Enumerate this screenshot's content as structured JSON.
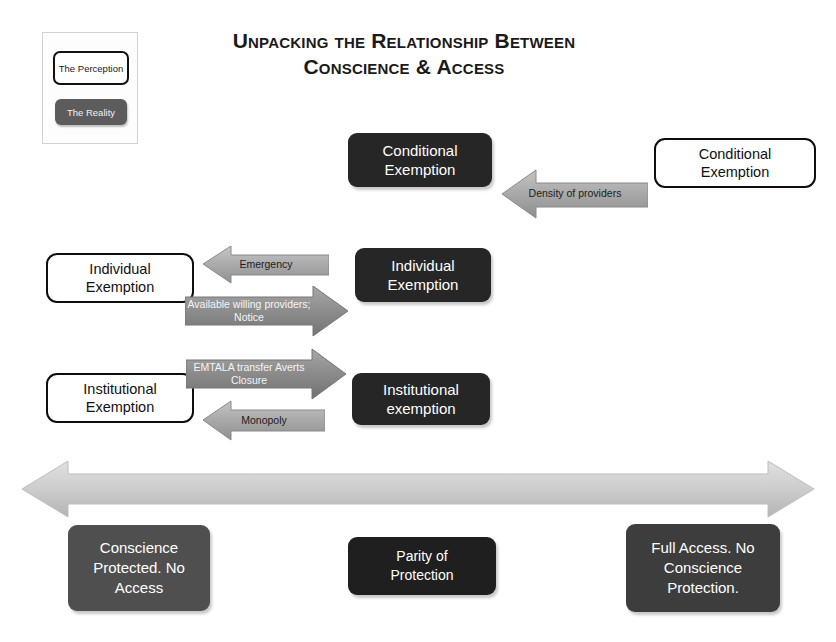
{
  "title": {
    "line1": "Unpacking the Relationship Between",
    "line2": "Conscience & Access"
  },
  "legend": {
    "perception_label": "The Perception",
    "reality_label": "The Reality",
    "perception_color": "#ffffff",
    "reality_color": "#5c5c5c"
  },
  "rows": [
    {
      "id": "conditional",
      "reality_label": "Conditional Exemption",
      "perception_label": "Conditional Exemption",
      "arrows": [
        {
          "direction": "left",
          "label": "Density of providers",
          "text_tone": "dark"
        }
      ]
    },
    {
      "id": "individual",
      "reality_label": "Individual Exemption",
      "perception_label": "Individual Exemption",
      "arrows": [
        {
          "direction": "left",
          "label": "Emergency",
          "text_tone": "dark"
        },
        {
          "direction": "right",
          "label": "Available willing providers; Notice",
          "text_tone": "light"
        }
      ]
    },
    {
      "id": "institutional",
      "reality_label": "Institutional exemption",
      "perception_label": "Institutional Exemption",
      "arrows": [
        {
          "direction": "right",
          "label": "EMTALA transfer Averts Closure",
          "text_tone": "light"
        },
        {
          "direction": "left",
          "label": "Monopoly",
          "text_tone": "dark"
        }
      ]
    }
  ],
  "arrow_labels": {
    "density": "Density of providers",
    "emergency": "Emergency",
    "available_line1": "Available willing",
    "available_line2": "providers; Notice",
    "emtala_line1": "EMTALA transfer",
    "emtala_line2": "Averts Closure",
    "monopoly": "Monopoly"
  },
  "nodes": {
    "conditional_reality_line1": "Conditional",
    "conditional_reality_line2": "Exemption",
    "conditional_perception_line1": "Conditional",
    "conditional_perception_line2": "Exemption",
    "individual_reality_line1": "Individual",
    "individual_reality_line2": "Exemption",
    "individual_perception_line1": "Individual",
    "individual_perception_line2": "Exemption",
    "institutional_reality_line1": "Institutional",
    "institutional_reality_line2": "exemption",
    "institutional_perception_line1": "Institutional",
    "institutional_perception_line2": "Exemption"
  },
  "spectrum": {
    "left_box": {
      "line1": "Conscience",
      "line2": "Protected. No",
      "line3": "Access",
      "color": "#5f5f5f"
    },
    "center_box": {
      "line1": "Parity of",
      "line2": "Protection",
      "color": "#1f1f1f"
    },
    "right_box": {
      "line1": "Full Access. No",
      "line2": "Conscience",
      "line3": "Protection.",
      "color": "#3d3d3d"
    },
    "axis_color": "#c9c9c9",
    "axis_direction": "double"
  }
}
